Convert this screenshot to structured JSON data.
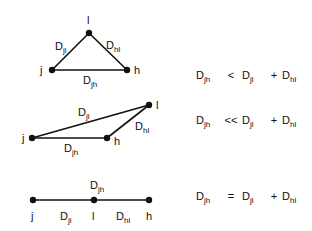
{
  "diagrams": [
    {
      "name": "triangle",
      "nodes": {
        "j": "j",
        "l": "l",
        "h": "h"
      },
      "edges": {
        "jl": {
          "base": "D",
          "sub": "jl"
        },
        "hl": {
          "base": "D",
          "sub": "hl"
        },
        "jh": {
          "base": "D",
          "sub": "jh"
        }
      },
      "equation": {
        "lhs": {
          "base": "D",
          "sub": "jh"
        },
        "op1": "<",
        "t1": {
          "base": "D",
          "sub": "jl"
        },
        "op2": "+",
        "t2": {
          "base": "D",
          "sub": "hl"
        }
      }
    },
    {
      "name": "flat-triangle",
      "nodes": {
        "j": "j",
        "l": "l",
        "h": "h"
      },
      "edges": {
        "jl": {
          "base": "D",
          "sub": "jl"
        },
        "hl": {
          "base": "D",
          "sub": "hl"
        },
        "jh": {
          "base": "D",
          "sub": "jh"
        }
      },
      "equation": {
        "lhs": {
          "base": "D",
          "sub": "jh"
        },
        "op1": "<<",
        "t1": {
          "base": "D",
          "sub": "jl"
        },
        "op2": "+",
        "t2": {
          "base": "D",
          "sub": "hl"
        }
      }
    },
    {
      "name": "collinear",
      "nodes": {
        "j": "j",
        "l": "l",
        "h": "h"
      },
      "edges": {
        "jl": {
          "base": "D",
          "sub": "jl"
        },
        "hl": {
          "base": "D",
          "sub": "hl"
        },
        "jh": {
          "base": "D",
          "sub": "jh"
        }
      },
      "equation": {
        "lhs": {
          "base": "D",
          "sub": "jh"
        },
        "op1": "=",
        "t1": {
          "base": "D",
          "sub": "jl"
        },
        "op2": "+",
        "t2": {
          "base": "D",
          "sub": "hl"
        }
      }
    }
  ]
}
